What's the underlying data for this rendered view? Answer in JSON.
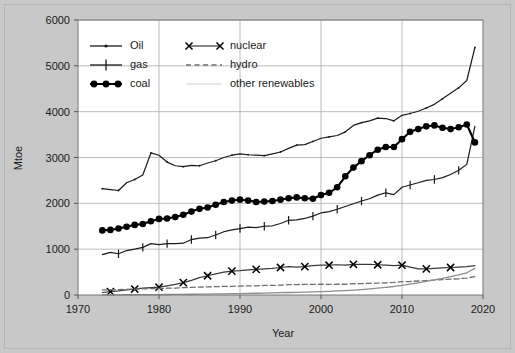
{
  "chart_data": {
    "type": "line",
    "title": "",
    "xlabel": "Year",
    "ylabel": "Mtoe",
    "xlim": [
      1970,
      2020
    ],
    "ylim": [
      0,
      6000
    ],
    "xticks": [
      1970,
      1980,
      1990,
      2000,
      2010,
      2020
    ],
    "yticks": [
      0,
      1000,
      2000,
      3000,
      4000,
      5000,
      6000
    ],
    "grid": true,
    "legend_position": "upper-left-inside",
    "legend": [
      "Oil",
      "gas",
      "coal",
      "nuclear",
      "hydro",
      "other renewables"
    ],
    "x": [
      1973,
      1974,
      1975,
      1976,
      1977,
      1978,
      1979,
      1980,
      1981,
      1982,
      1983,
      1984,
      1985,
      1986,
      1987,
      1988,
      1989,
      1990,
      1991,
      1992,
      1993,
      1994,
      1995,
      1996,
      1997,
      1998,
      1999,
      2000,
      2001,
      2002,
      2003,
      2004,
      2005,
      2006,
      2007,
      2008,
      2009,
      2010,
      2011,
      2012,
      2013,
      2014,
      2015,
      2016,
      2017,
      2018,
      2019
    ],
    "series": [
      {
        "name": "Oil",
        "marker": "dot",
        "linestyle": "solid",
        "color": "#1a1a1a",
        "values": [
          2320,
          2300,
          2280,
          2450,
          2520,
          2620,
          3100,
          3050,
          2900,
          2820,
          2800,
          2830,
          2820,
          2880,
          2930,
          3000,
          3050,
          3080,
          3060,
          3050,
          3040,
          3080,
          3120,
          3200,
          3270,
          3280,
          3350,
          3420,
          3450,
          3480,
          3560,
          3700,
          3760,
          3800,
          3860,
          3850,
          3800,
          3920,
          3960,
          4010,
          4080,
          4160,
          4280,
          4400,
          4520,
          4680,
          5400
        ]
      },
      {
        "name": "gas",
        "marker": "plus",
        "linestyle": "solid",
        "color": "#1a1a1a",
        "values": [
          880,
          930,
          900,
          970,
          1000,
          1040,
          1120,
          1100,
          1120,
          1120,
          1130,
          1210,
          1240,
          1250,
          1310,
          1380,
          1420,
          1450,
          1480,
          1470,
          1500,
          1510,
          1560,
          1630,
          1640,
          1670,
          1720,
          1790,
          1820,
          1870,
          1930,
          1990,
          2050,
          2100,
          2180,
          2230,
          2190,
          2350,
          2400,
          2450,
          2500,
          2520,
          2560,
          2630,
          2720,
          2850,
          3680
        ]
      },
      {
        "name": "coal",
        "marker": "circle",
        "linestyle": "solid",
        "color": "#000000",
        "values": [
          1410,
          1420,
          1450,
          1490,
          1530,
          1550,
          1610,
          1660,
          1670,
          1700,
          1750,
          1820,
          1880,
          1910,
          1970,
          2030,
          2060,
          2080,
          2060,
          2030,
          2040,
          2050,
          2080,
          2110,
          2130,
          2110,
          2100,
          2180,
          2230,
          2350,
          2590,
          2780,
          2920,
          3050,
          3170,
          3230,
          3230,
          3400,
          3560,
          3620,
          3680,
          3700,
          3650,
          3620,
          3660,
          3720,
          3330
        ]
      },
      {
        "name": "nuclear",
        "marker": "x",
        "linestyle": "solid",
        "color": "#3a3a3a",
        "values": [
          55,
          75,
          90,
          110,
          130,
          150,
          160,
          170,
          200,
          230,
          270,
          320,
          380,
          420,
          460,
          500,
          520,
          530,
          550,
          560,
          570,
          580,
          600,
          620,
          610,
          620,
          640,
          650,
          650,
          660,
          650,
          670,
          670,
          670,
          660,
          650,
          640,
          650,
          610,
          570,
          570,
          580,
          590,
          600,
          610,
          620,
          640
        ]
      },
      {
        "name": "hydro",
        "marker": "none",
        "linestyle": "dashed",
        "color": "#6e6e6e",
        "values": [
          110,
          115,
          118,
          122,
          128,
          135,
          138,
          142,
          148,
          152,
          160,
          168,
          172,
          178,
          182,
          188,
          190,
          195,
          198,
          200,
          208,
          210,
          215,
          225,
          228,
          230,
          232,
          235,
          232,
          235,
          235,
          245,
          250,
          255,
          260,
          265,
          275,
          290,
          295,
          305,
          315,
          325,
          335,
          345,
          355,
          370,
          400
        ]
      },
      {
        "name": "other renewables",
        "marker": "none",
        "linestyle": "solid",
        "color": "#8c8c8c",
        "values": [
          2,
          3,
          4,
          5,
          6,
          7,
          8,
          9,
          11,
          12,
          14,
          16,
          18,
          20,
          23,
          26,
          29,
          32,
          35,
          38,
          42,
          46,
          50,
          54,
          58,
          62,
          68,
          74,
          80,
          88,
          96,
          106,
          118,
          132,
          148,
          166,
          186,
          210,
          238,
          266,
          296,
          330,
          364,
          400,
          440,
          485,
          580
        ]
      }
    ]
  },
  "legend_labels": {
    "oil": "Oil",
    "gas": "gas",
    "coal": "coal",
    "nuclear": "nuclear",
    "hydro": "hydro",
    "other_renewables": "other renewables"
  },
  "axis": {
    "y_title": "Mtoe",
    "x_title": "Year",
    "y_ticks": [
      "0",
      "1000",
      "2000",
      "3000",
      "4000",
      "5000",
      "6000"
    ],
    "x_ticks": [
      "1970",
      "1980",
      "1990",
      "2000",
      "2010",
      "2020"
    ]
  },
  "colors": {
    "background": "#c8c8c8",
    "plot_background": "#ffffff",
    "grid": "#aaaaaa",
    "axis": "#555555",
    "text": "#1a1a1a"
  }
}
